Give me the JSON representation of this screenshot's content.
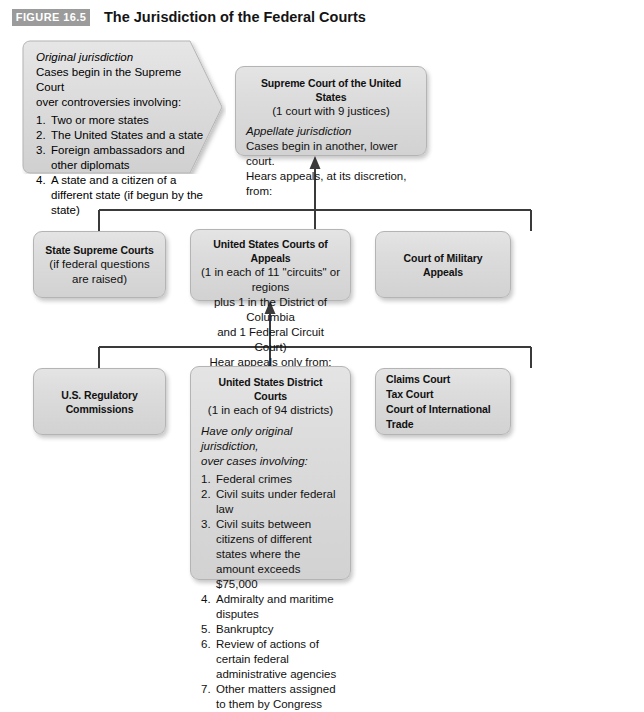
{
  "figure": {
    "badge": "FIGURE 16.5",
    "title": "The Jurisdiction of the Federal Courts"
  },
  "colors": {
    "badge_bg": "#9b9b9b",
    "box_fill": "#dcdcdc",
    "box_border": "#b4b4b4",
    "connector": "#3a3a3a",
    "text": "#111111"
  },
  "callout": {
    "heading": "Original jurisdiction",
    "line1": "Cases begin in the Supreme Court",
    "line2": "over controversies involving:",
    "items": [
      {
        "num": "1.",
        "text": "Two or more states"
      },
      {
        "num": "2.",
        "text": "The United States and a state"
      },
      {
        "num": "3.",
        "text": "Foreign ambassadors and other diplomats"
      },
      {
        "num": "4.",
        "text": "A state and a citizen of a different state (if begun by the state)"
      }
    ]
  },
  "nodes": {
    "supreme": {
      "title": "Supreme Court of the United States",
      "subtitle": "(1 court with 9 justices)",
      "italic": "Appellate jurisdiction",
      "line1": "Cases begin in another, lower court.",
      "line2": "Hears appeals, at its discretion, from:"
    },
    "state_supreme": {
      "title": "State Supreme Courts",
      "subtitle": "(if federal questions are raised)"
    },
    "appeals": {
      "title": "United States Courts of Appeals",
      "sub1": "(1 in each of 11 \"circuits\" or regions",
      "sub2": "plus 1 in the District of Columbia",
      "sub3": "and 1 Federal Circuit Court)",
      "sub4": "Hear appeals only from:"
    },
    "military": {
      "title": "Court of Military Appeals"
    },
    "regulatory": {
      "title": "U.S. Regulatory Commissions"
    },
    "claims": {
      "line1": "Claims Court",
      "line2": "Tax Court",
      "line3": "Court of International Trade"
    },
    "district": {
      "title": "United States District Courts",
      "subtitle": "(1 in each of 94 districts)",
      "italic1": "Have only original jurisdiction,",
      "italic2": "over cases involving:",
      "items": [
        {
          "num": "1.",
          "text": "Federal crimes"
        },
        {
          "num": "2.",
          "text": "Civil suits under federal law"
        },
        {
          "num": "3.",
          "text": "Civil suits between citizens of different states where the amount exceeds $75,000"
        },
        {
          "num": "4.",
          "text": "Admiralty and maritime disputes"
        },
        {
          "num": "5.",
          "text": "Bankruptcy"
        },
        {
          "num": "6.",
          "text": "Review of actions of certain federal administrative agencies"
        },
        {
          "num": "7.",
          "text": "Other matters assigned to them by Congress"
        }
      ]
    }
  }
}
